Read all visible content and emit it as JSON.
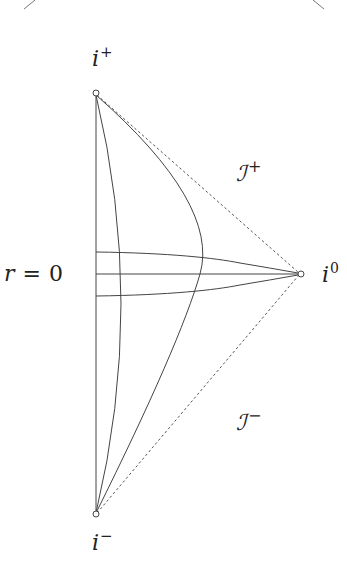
{
  "diagram": {
    "labels": {
      "future_timelike_infinity": {
        "base": "i",
        "sup": "+"
      },
      "past_timelike_infinity": {
        "base": "i",
        "sup": "−"
      },
      "spatial_infinity": {
        "base": "i",
        "sup": "0"
      },
      "future_null_infinity": {
        "base": "ℐ",
        "sup": "+"
      },
      "past_null_infinity": {
        "base": "ℐ",
        "sup": "−"
      },
      "origin": {
        "lhs": "r",
        "eq": "=",
        "rhs": "0"
      }
    },
    "colors": {
      "line": "#444444",
      "dashed": "#555555",
      "text": "#222222",
      "background": "#ffffff"
    }
  }
}
